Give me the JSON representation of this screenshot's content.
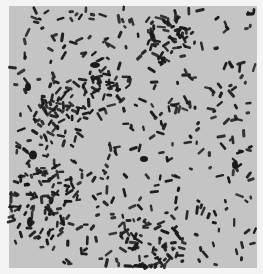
{
  "image": {
    "subject": "micrograph of rod-shaped bacteria (bacilli)",
    "width": 263,
    "height": 274,
    "field": {
      "x": 9,
      "y": 6,
      "width": 248,
      "height": 262
    },
    "colors": {
      "border": "#f4f4f4",
      "field": "#c4c4c4",
      "cell": "#1a1a1a"
    },
    "seed": 20241,
    "rod_count": 620,
    "rod_length_range": [
      4,
      10
    ],
    "rod_width_range": [
      2.2,
      3.2
    ],
    "dense_regions": [
      {
        "cx": 40,
        "cy": 200,
        "r": 40,
        "weight": 1.6
      },
      {
        "cx": 150,
        "cy": 250,
        "r": 35,
        "weight": 1.5
      },
      {
        "cx": 95,
        "cy": 95,
        "r": 25,
        "weight": 1.2
      },
      {
        "cx": 170,
        "cy": 40,
        "r": 25,
        "weight": 1.2
      },
      {
        "cx": 55,
        "cy": 110,
        "r": 20,
        "weight": 1.1
      }
    ],
    "clumps": [
      {
        "cx": 33,
        "cy": 155,
        "rx": 4,
        "ry": 4.5
      },
      {
        "cx": 30,
        "cy": 222,
        "rx": 3,
        "ry": 5
      },
      {
        "cx": 95,
        "cy": 65,
        "rx": 5,
        "ry": 3
      },
      {
        "cx": 235,
        "cy": 165,
        "rx": 3,
        "ry": 4
      },
      {
        "cx": 144,
        "cy": 159,
        "rx": 4,
        "ry": 3
      },
      {
        "cx": 28,
        "cy": 87,
        "rx": 3,
        "ry": 4
      }
    ]
  }
}
